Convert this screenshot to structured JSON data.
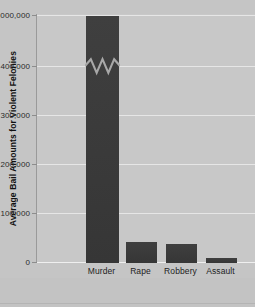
{
  "chart_data": {
    "type": "bar",
    "title": "",
    "xlabel": "",
    "ylabel": "Average Bail Amounts for Violent Felonies",
    "categories": [
      "Murder",
      "Rape",
      "Robbery",
      "Assault"
    ],
    "values": [
      1000000,
      42000,
      38000,
      11000
    ],
    "ytick_labels": [
      "$1,000,000",
      "400,000",
      "300,000",
      "200,000",
      "100,000",
      "0"
    ],
    "ytick_values": [
      1000000,
      400000,
      300000,
      200000,
      100000,
      0
    ],
    "ylim": [
      0,
      1000000
    ],
    "axis_break": true,
    "axis_break_note": "y-axis broken between 400,000 and 1,000,000; zigzag drawn across the Murder bar",
    "grid": true,
    "legend": "none",
    "colors": {
      "bar": "#3b3b3b",
      "plot_background": "#c8c8c8",
      "page_background": "#c5c5c5",
      "gridline": "#e6e6e6",
      "axis": "#9a9a9a",
      "text": "#1d1d1d"
    }
  }
}
